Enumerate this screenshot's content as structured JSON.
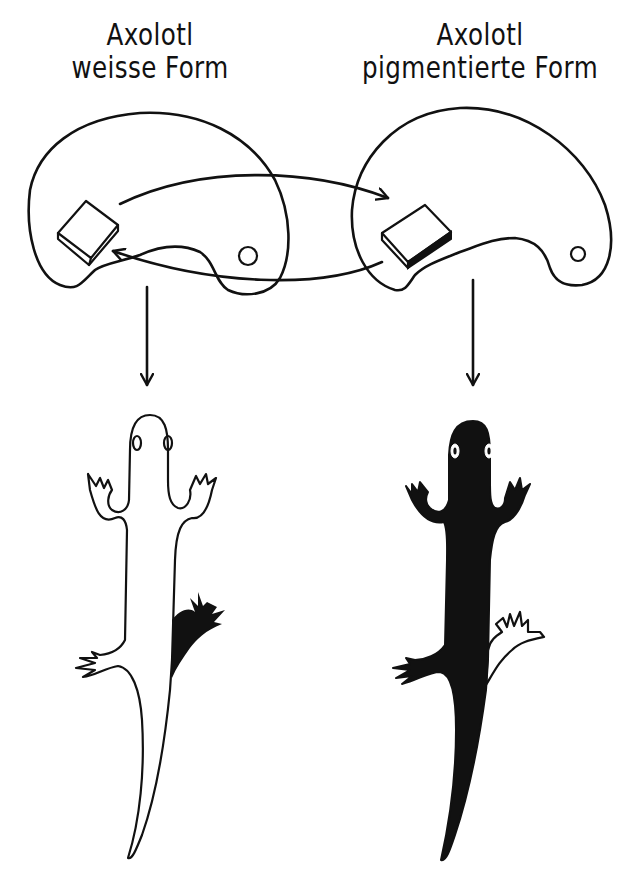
{
  "figure": {
    "left_panel": {
      "title_line1": "Axolotl",
      "title_line2": "weisse Form",
      "body_color": "#ffffff",
      "transplanted_limb_color": "#000000"
    },
    "right_panel": {
      "title_line1": "Axolotl",
      "title_line2": "pigmentierte Form",
      "body_color": "#000000",
      "transplanted_limb_color": "#ffffff"
    },
    "arrows": {
      "exchange": "bidirectional tissue transplant between embryos",
      "development": "embryo develops into adult axolotl"
    },
    "colors": {
      "ink": "#111111",
      "background": "#ffffff"
    }
  }
}
